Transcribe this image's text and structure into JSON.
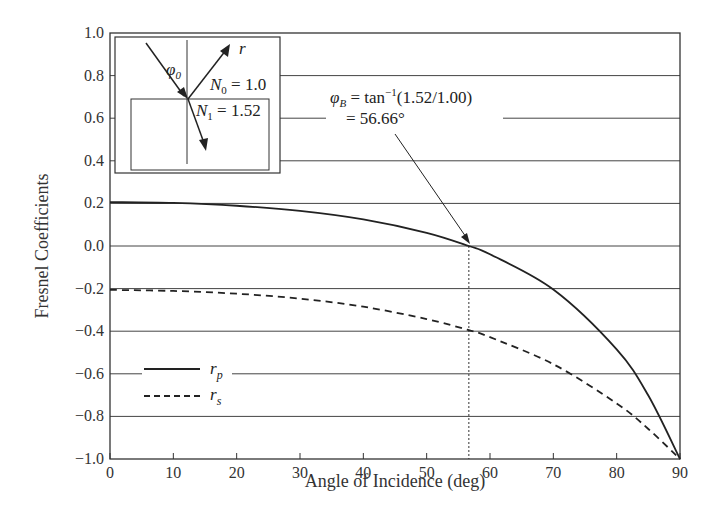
{
  "chart_data": {
    "type": "line",
    "title": "",
    "xlabel": "Angle of Incidence (deg)",
    "ylabel": "Fresnel Coefficients",
    "xlim": [
      0,
      90
    ],
    "ylim": [
      -1.0,
      1.0
    ],
    "grid": "horizontal",
    "x_ticks": [
      "0",
      "10",
      "20",
      "30",
      "40",
      "50",
      "60",
      "70",
      "80",
      "90"
    ],
    "y_ticks": [
      "1.0",
      "0.8",
      "0.6",
      "0.4",
      "0.2",
      "0.0",
      "-0.2",
      "-0.4",
      "-0.6",
      "-0.8",
      "-1.0"
    ],
    "x": [
      0,
      10,
      20,
      30,
      40,
      50,
      56.66,
      60,
      70,
      80,
      85,
      90
    ],
    "series": [
      {
        "name": "r_p",
        "style": "solid",
        "values": [
          0.206,
          0.202,
          0.189,
          0.165,
          0.125,
          0.062,
          0.0,
          -0.039,
          -0.204,
          -0.485,
          -0.702,
          -1.0
        ]
      },
      {
        "name": "r_s",
        "style": "dashed",
        "values": [
          -0.206,
          -0.211,
          -0.224,
          -0.247,
          -0.285,
          -0.343,
          -0.395,
          -0.428,
          -0.555,
          -0.739,
          -0.859,
          -1.0
        ]
      }
    ],
    "legend": {
      "position": "lower-left",
      "entries": [
        {
          "label": "r",
          "sub": "p",
          "style": "solid"
        },
        {
          "label": "r",
          "sub": "s",
          "style": "dashed"
        }
      ]
    },
    "annotations": [
      {
        "text_line1": "φB = tan⁻¹(1.52/1.00)",
        "text_line2": "= 56.66°",
        "points_to": [
          56.66,
          0.0
        ]
      },
      {
        "type": "vertical-dotted-line",
        "x": 56.66
      }
    ],
    "inset": {
      "labels": {
        "phi": "φ",
        "phi_sub": "0",
        "r": "r",
        "n0": "N",
        "n0_sub": "0",
        "n0_val": " = 1.0",
        "n1": "N",
        "n1_sub": "1",
        "n1_val": " = 1.52"
      }
    }
  },
  "labels": {
    "xlabel": "Angle of Incidence (deg)",
    "ylabel": "Fresnel Coefficients",
    "brewster_phi": "φ",
    "brewster_sub": "B",
    "brewster_eq": " = tan",
    "brewster_sup": "−1",
    "brewster_arg": "(1.52/1.00)",
    "brewster_val": "= 56.66°",
    "legend_r": "r",
    "legend_p": "p",
    "legend_s": "s"
  }
}
